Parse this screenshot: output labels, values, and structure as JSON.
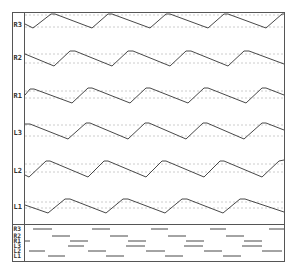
{
  "chart_data": {
    "type": "line",
    "title": "",
    "xlabel": "",
    "ylabel": "",
    "grid": false,
    "legend": "none",
    "frame": {
      "left": 12,
      "top": 12,
      "right": 284,
      "bottom": 261,
      "label_col_right": 24,
      "raster_top": 224
    },
    "waveform_panel": {
      "description": "Six phase-shifted triangular waveforms, one per lane, each with two dotted reference lines",
      "lanes": [
        {
          "name": "R3",
          "label_y": 24,
          "guide_top": 15,
          "guide_bottom": 27,
          "points": [
            [
              25,
              24
            ],
            [
              33,
              28
            ],
            [
              51,
              14
            ],
            [
              55,
              14
            ],
            [
              92,
              28
            ],
            [
              108,
              14
            ],
            [
              112,
              14
            ],
            [
              150,
              28
            ],
            [
              166,
              14
            ],
            [
              170,
              14
            ],
            [
              208,
              28
            ],
            [
              224,
              14
            ],
            [
              228,
              14
            ],
            [
              266,
              28
            ],
            [
              282,
              14
            ],
            [
              284,
              14
            ]
          ]
        },
        {
          "name": "R2",
          "label_y": 57,
          "guide_top": 54,
          "guide_bottom": 63,
          "points": [
            [
              25,
              54
            ],
            [
              54,
              66
            ],
            [
              70,
              51
            ],
            [
              75,
              51
            ],
            [
              112,
              66
            ],
            [
              128,
              51
            ],
            [
              133,
              51
            ],
            [
              170,
              66
            ],
            [
              186,
              51
            ],
            [
              191,
              51
            ],
            [
              228,
              66
            ],
            [
              244,
              51
            ],
            [
              249,
              51
            ],
            [
              284,
              64
            ]
          ]
        },
        {
          "name": "R1",
          "label_y": 95,
          "guide_top": 91,
          "guide_bottom": 98,
          "points": [
            [
              25,
              95
            ],
            [
              30,
              89
            ],
            [
              34,
              89
            ],
            [
              72,
              103
            ],
            [
              88,
              88
            ],
            [
              92,
              88
            ],
            [
              130,
              103
            ],
            [
              146,
              88
            ],
            [
              150,
              88
            ],
            [
              188,
              103
            ],
            [
              204,
              88
            ],
            [
              208,
              88
            ],
            [
              246,
              103
            ],
            [
              262,
              88
            ],
            [
              266,
              88
            ],
            [
              284,
              95
            ]
          ]
        },
        {
          "name": "L3",
          "label_y": 132,
          "guide_top": 125,
          "guide_bottom": 136,
          "points": [
            [
              25,
              124
            ],
            [
              30,
              124
            ],
            [
              68,
              139
            ],
            [
              86,
              123
            ],
            [
              90,
              123
            ],
            [
              128,
              139
            ],
            [
              145,
              123
            ],
            [
              149,
              123
            ],
            [
              186,
              139
            ],
            [
              203,
              123
            ],
            [
              207,
              123
            ],
            [
              244,
              139
            ],
            [
              262,
              123
            ],
            [
              266,
              123
            ],
            [
              284,
              130
            ]
          ]
        },
        {
          "name": "L2",
          "label_y": 170,
          "guide_top": 164,
          "guide_bottom": 172,
          "points": [
            [
              25,
              175
            ],
            [
              29,
              177
            ],
            [
              46,
              161
            ],
            [
              50,
              161
            ],
            [
              88,
              177
            ],
            [
              104,
              161
            ],
            [
              108,
              161
            ],
            [
              146,
              177
            ],
            [
              162,
              161
            ],
            [
              166,
              161
            ],
            [
              204,
              177
            ],
            [
              220,
              161
            ],
            [
              224,
              161
            ],
            [
              262,
              177
            ],
            [
              279,
              161
            ],
            [
              284,
              160
            ]
          ]
        },
        {
          "name": "L1",
          "label_y": 206,
          "guide_top": 202,
          "guide_bottom": 208,
          "points": [
            [
              25,
              205
            ],
            [
              48,
              213
            ],
            [
              65,
              199
            ],
            [
              70,
              199
            ],
            [
              106,
              213
            ],
            [
              123,
              199
            ],
            [
              128,
              199
            ],
            [
              165,
              213
            ],
            [
              182,
              199
            ],
            [
              187,
              199
            ],
            [
              223,
              213
            ],
            [
              240,
              199
            ],
            [
              245,
              199
            ],
            [
              284,
              212
            ]
          ]
        }
      ]
    },
    "raster_panel": {
      "description": "Horizontal activity bars per lane",
      "rows": [
        {
          "name": "R3",
          "y": 229,
          "bars": [
            [
              33,
              52
            ],
            [
              92,
              110
            ],
            [
              151,
              168
            ],
            [
              210,
              226
            ],
            [
              269,
              284
            ]
          ]
        },
        {
          "name": "R2",
          "y": 236,
          "bars": [
            [
              52,
              70
            ],
            [
              110,
              128
            ],
            [
              168,
              186
            ],
            [
              226,
              244
            ]
          ]
        },
        {
          "name": "R1",
          "y": 241,
          "bars": [
            [
              25,
              30
            ],
            [
              70,
              88
            ],
            [
              128,
              146
            ],
            [
              186,
              204
            ],
            [
              244,
              262
            ]
          ]
        },
        {
          "name": "L3",
          "y": 246,
          "bars": [
            [
              68,
              84
            ],
            [
              126,
              145
            ],
            [
              184,
              203
            ],
            [
              242,
              262
            ]
          ]
        },
        {
          "name": "L2",
          "y": 251,
          "bars": [
            [
              29,
              45
            ],
            [
              88,
              106
            ],
            [
              146,
              165
            ],
            [
              204,
              222
            ],
            [
              262,
              282
            ]
          ]
        },
        {
          "name": "L1",
          "y": 256,
          "bars": [
            [
              48,
              65
            ],
            [
              106,
              124
            ],
            [
              165,
              183
            ],
            [
              223,
              241
            ]
          ]
        }
      ]
    }
  },
  "labels": {
    "lanes": [
      "R3",
      "R2",
      "R1",
      "L3",
      "L2",
      "L1"
    ],
    "raster": [
      "R3",
      "R2",
      "R1",
      "L3",
      "L2",
      "L1"
    ]
  }
}
